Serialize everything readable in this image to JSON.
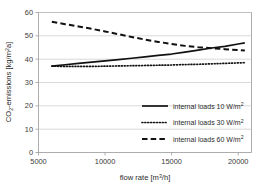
{
  "chart_data": {
    "type": "line",
    "title": "",
    "xlabel": "flow rate [m³/h]",
    "ylabel": "CO₂-emissions [kg/m²a]",
    "xlabel_main": "flow rate [m",
    "xlabel_sup": "3",
    "xlabel_tail": "/h]",
    "ylabel_head": "CO",
    "ylabel_sub": "2",
    "ylabel_mid": "-emissions [kg/m",
    "ylabel_sup": "2",
    "ylabel_tail": "a]",
    "xlim": [
      5000,
      21000
    ],
    "ylim": [
      0,
      60
    ],
    "grid": "horizontal",
    "legend_position": "inside-lower-right",
    "xticks": [
      5000,
      10000,
      15000,
      20000
    ],
    "xtick_labels": [
      "5000",
      "10000",
      "15000",
      "20000"
    ],
    "yticks": [
      0,
      10,
      20,
      30,
      40,
      50,
      60
    ],
    "ytick_labels": [
      "0",
      "10",
      "20",
      "30",
      "40",
      "50",
      "60"
    ],
    "series": [
      {
        "name": "internal loads 10 W/m²",
        "label_main": "internal loads 10 W/m",
        "label_sup": "2",
        "style": "solid",
        "color": "#111111",
        "x": [
          6000,
          7000,
          8000,
          9000,
          10000,
          11000,
          12000,
          13000,
          14000,
          15000,
          16000,
          17000,
          18000,
          19000,
          20000,
          20500
        ],
        "y": [
          37.0,
          37.6,
          38.2,
          38.7,
          39.3,
          39.8,
          40.4,
          41.0,
          41.6,
          42.2,
          43.0,
          43.9,
          44.8,
          45.5,
          46.5,
          47.0
        ]
      },
      {
        "name": "internal loads 30 W/m²",
        "label_main": "internal loads 30 W/m",
        "label_sup": "2",
        "style": "dotted",
        "color": "#111111",
        "x": [
          6000,
          7000,
          8000,
          9000,
          10000,
          11000,
          12000,
          13000,
          14000,
          15000,
          16000,
          17000,
          18000,
          19000,
          20000,
          20500
        ],
        "y": [
          37.0,
          36.9,
          36.9,
          36.9,
          37.0,
          37.1,
          37.2,
          37.3,
          37.4,
          37.5,
          37.7,
          37.8,
          38.0,
          38.2,
          38.4,
          38.5
        ]
      },
      {
        "name": "internal loads 60 W/m²",
        "label_main": "internal loads 60 W/m",
        "label_sup": "2",
        "style": "dashed",
        "color": "#111111",
        "x": [
          6000,
          7000,
          8000,
          9000,
          10000,
          11000,
          12000,
          13000,
          14000,
          15000,
          16000,
          17000,
          18000,
          19000,
          20000,
          20500
        ],
        "y": [
          56.0,
          55.0,
          54.0,
          53.0,
          51.9,
          50.7,
          49.5,
          48.4,
          47.4,
          46.5,
          45.7,
          45.1,
          44.7,
          44.3,
          43.9,
          43.7
        ]
      }
    ]
  },
  "legend": {
    "items": [
      {
        "label_main": "internal loads 10 W/m",
        "label_sup": "2",
        "style": "solid"
      },
      {
        "label_main": "internal loads 30 W/m",
        "label_sup": "2",
        "style": "dotted"
      },
      {
        "label_main": "internal loads 60 W/m",
        "label_sup": "2",
        "style": "dashed"
      }
    ]
  },
  "colors": {
    "plot_border": "#9a9a9a",
    "gridline": "#c9c9c9",
    "series_line": "#111111",
    "tick_text": "#3a3a3a",
    "background": "#ffffff"
  }
}
